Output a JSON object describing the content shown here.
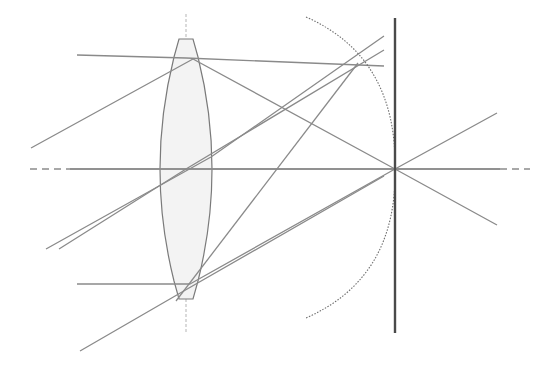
{
  "diagram": {
    "colors": {
      "background": "#ffffff",
      "ray": "#8a8a8a",
      "lens_outline": "#7a7a7a",
      "lens_fill": "#f3f3f3",
      "axis": "#8c8c8c",
      "focal_plane": "#4a4a4a",
      "petzval_arc": "#6e6e6e"
    },
    "optical_axis": {
      "y": 169,
      "dash_left": [
        30,
        70
      ],
      "solid": [
        70,
        500
      ],
      "dash_right": [
        500,
        530
      ]
    },
    "lens": {
      "center_x": 186,
      "top_y": 39,
      "bottom_y": 299,
      "flat_half_width": 7,
      "edge_half_width": 12,
      "bulge_half_width": 26
    },
    "lens_axis": {
      "x": 186,
      "y1": 14,
      "y2": 332
    },
    "focal_plane": {
      "x": 395,
      "y1": 18,
      "y2": 333
    },
    "petzval_arc": {
      "start": [
        306,
        17
      ],
      "through": [
        358,
        63
      ],
      "vertex": [
        395,
        169
      ],
      "end": [
        306,
        318
      ]
    },
    "focus_points": {
      "on_axis": [
        395,
        169
      ],
      "off_axis": [
        358,
        63
      ]
    },
    "rays": [
      {
        "name": "top-parallel-ray",
        "points": [
          [
            77,
            55
          ],
          [
            186,
            58
          ],
          [
            384,
            66
          ]
        ]
      },
      {
        "name": "top-oblique-ray",
        "points": [
          [
            31,
            148
          ],
          [
            193,
            59
          ],
          [
            395,
            169
          ],
          [
            497,
            225
          ]
        ]
      },
      {
        "name": "upper-chief-ray",
        "points": [
          [
            46,
            249
          ],
          [
            211,
            157
          ],
          [
            384,
            36
          ]
        ]
      },
      {
        "name": "axial-ray",
        "points": [
          [
            70,
            169
          ],
          [
            395,
            169
          ],
          [
            500,
            169
          ]
        ]
      },
      {
        "name": "upper-cross-ray",
        "points": [
          [
            59,
            249
          ],
          [
            186,
            169
          ],
          [
            384,
            50
          ]
        ]
      },
      {
        "name": "lower-parallel-ray",
        "points": [
          [
            77,
            284
          ],
          [
            190,
            284
          ],
          [
            395,
            169
          ],
          [
            497,
            113
          ]
        ]
      },
      {
        "name": "lower-oblique-ray",
        "points": [
          [
            80,
            351
          ],
          [
            182,
            292
          ],
          [
            384,
            176
          ]
        ]
      },
      {
        "name": "bottom-converging-ray",
        "points": [
          [
            176,
            301
          ],
          [
            358,
            63
          ]
        ]
      }
    ]
  }
}
